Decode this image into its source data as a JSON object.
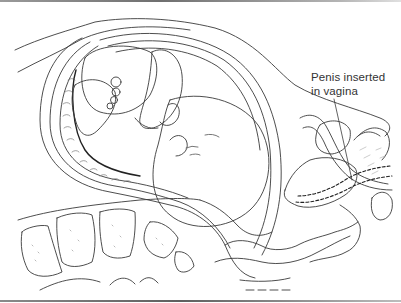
{
  "figure": {
    "type": "anatomical-line-illustration",
    "colors": {
      "line": "#3a3a3a",
      "stipple": "#9a9a9a",
      "background": "#ffffff",
      "rule": "#6f6f6f"
    },
    "labels": [
      {
        "line1": "Penis inserted",
        "line2": "in vagina"
      }
    ]
  }
}
